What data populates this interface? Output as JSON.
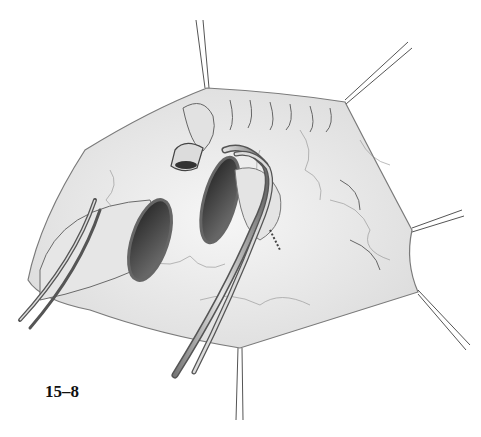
{
  "figure": {
    "label": "15–8"
  },
  "colors": {
    "tissue": "#ececec",
    "tissue_shadow": "#cfcfcf",
    "outline": "#6a6a6a",
    "lumen": "#3a3a3a",
    "instrument": "#9a9a9a"
  }
}
